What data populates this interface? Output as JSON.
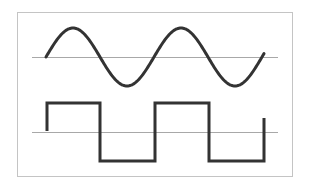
{
  "figure": {
    "frame": {
      "x": 17,
      "y": 12,
      "width": 275,
      "height": 164,
      "stroke": "#c4c4c4"
    },
    "colors": {
      "background": "#ffffff",
      "frame": "#c4c4c4",
      "axis": "#a8a8a8",
      "wave": "#333333"
    },
    "sine_wave": {
      "label": "sine-wave",
      "axis_y": 57,
      "axis_x_start": 32,
      "axis_x_end": 278,
      "x_start": 46,
      "x_end": 264,
      "amplitude": 29,
      "period": 108,
      "cycles": 2
    },
    "square_wave": {
      "label": "square-wave",
      "axis_y": 132,
      "axis_x_start": 32,
      "axis_x_end": 278,
      "high_y": 103,
      "low_y": 161,
      "points": [
        [
          47,
          131
        ],
        [
          47,
          103
        ],
        [
          100,
          103
        ],
        [
          100,
          161
        ],
        [
          155,
          161
        ],
        [
          155,
          103
        ],
        [
          209,
          103
        ],
        [
          209,
          161
        ],
        [
          264,
          161
        ],
        [
          264,
          118
        ]
      ]
    }
  }
}
